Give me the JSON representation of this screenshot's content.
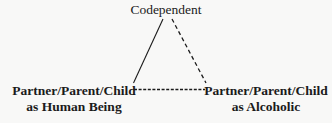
{
  "diagram": {
    "type": "triangle-relationship-diagram",
    "background_color": "#f8f8f7",
    "ink_color": "#1b1b1b",
    "nodes": {
      "top": {
        "label": "Codependent"
      },
      "left": {
        "line1": "Partner/Parent/Child",
        "line2": "as Human Being"
      },
      "right": {
        "line1": "Partner/Parent/Child",
        "line2": "as Alcoholic"
      }
    },
    "edges": [
      {
        "name": "codependent-to-human-being",
        "style": "solid",
        "from": "top",
        "to": "left"
      },
      {
        "name": "codependent-to-alcoholic",
        "style": "dashed",
        "from": "top",
        "to": "right"
      },
      {
        "name": "human-being-to-alcoholic",
        "style": "dashed",
        "from": "left",
        "to": "right"
      }
    ]
  }
}
